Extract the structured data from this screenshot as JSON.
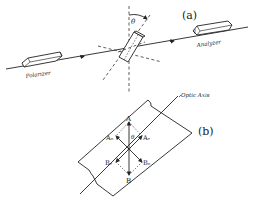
{
  "figure_a": {
    "label": "(a)",
    "polarizer_label": "Polarizer",
    "analyzer_label": "Analyzer",
    "angle_label": "θ"
  },
  "figure_b": {
    "label": "(b)",
    "optic_axis_label": "Optic Axis",
    "angle_label": "θ",
    "vectors": {
      "A": "A",
      "B": "B",
      "Ao": "Aₒ",
      "Ae": "Aₑ",
      "Be": "Bₑ",
      "Bo": "Bₒ"
    }
  }
}
